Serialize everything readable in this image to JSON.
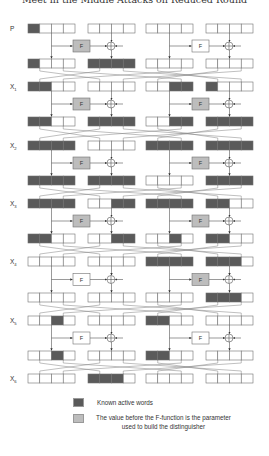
{
  "header": {
    "title": "Meet in the Middle Attacks on Reduced Round"
  },
  "colors": {
    "active": "#5a5a5a",
    "f_param": "#bdbdbd",
    "f_plain": "#ffffff",
    "stroke": "#707070",
    "line": "#808080"
  },
  "diagram": {
    "block_x": [
      28,
      88,
      146,
      206
    ],
    "cell_w": 11.75,
    "cell_h": 9,
    "f_box": [
      {
        "x": 73,
        "w": 17
      },
      {
        "x": 192,
        "w": 17
      }
    ],
    "xor_x": [
      111,
      229
    ],
    "f_label": "F",
    "rounds": [
      {
        "label": "P",
        "sub": "",
        "y": 24,
        "cells": [
          [
            1,
            0,
            0,
            0
          ],
          [
            0,
            0,
            0,
            0
          ],
          [
            0,
            0,
            0,
            0
          ],
          [
            0,
            0,
            0,
            0
          ]
        ],
        "f_shaded": [
          true,
          false
        ],
        "y_after": 59,
        "after": [
          [
            1,
            0,
            0,
            0
          ],
          [
            1,
            1,
            1,
            1
          ],
          [
            0,
            0,
            0,
            0
          ],
          [
            0,
            0,
            0,
            0
          ]
        ]
      },
      {
        "label": "X",
        "sub": "1",
        "y": 82,
        "cells": [
          [
            1,
            1,
            0,
            0
          ],
          [
            0,
            0,
            0,
            0
          ],
          [
            0,
            0,
            1,
            1
          ],
          [
            1,
            0,
            0,
            0
          ]
        ],
        "f_shaded": [
          true,
          true
        ],
        "y_after": 117,
        "after": [
          [
            1,
            1,
            0,
            0
          ],
          [
            1,
            1,
            1,
            1
          ],
          [
            0,
            0,
            1,
            1
          ],
          [
            1,
            1,
            1,
            1
          ]
        ]
      },
      {
        "label": "X",
        "sub": "2",
        "y": 141,
        "cells": [
          [
            1,
            1,
            1,
            1
          ],
          [
            0,
            0,
            0,
            0
          ],
          [
            1,
            1,
            1,
            1
          ],
          [
            1,
            1,
            1,
            1
          ]
        ],
        "f_shaded": [
          true,
          true
        ],
        "y_after": 176,
        "after": [
          [
            1,
            1,
            1,
            1
          ],
          [
            1,
            1,
            1,
            1
          ],
          [
            0,
            0,
            0,
            0
          ],
          [
            1,
            1,
            1,
            1
          ]
        ]
      },
      {
        "label": "X",
        "sub": "3",
        "y": 199,
        "cells": [
          [
            1,
            1,
            1,
            1
          ],
          [
            0,
            0,
            1,
            1
          ],
          [
            1,
            1,
            1,
            1
          ],
          [
            1,
            1,
            0,
            0
          ]
        ],
        "f_shaded": [
          true,
          true
        ],
        "y_after": 234,
        "after": [
          [
            1,
            1,
            0,
            0
          ],
          [
            0,
            0,
            1,
            1
          ],
          [
            0,
            0,
            1,
            0
          ],
          [
            1,
            1,
            0,
            0
          ]
        ]
      },
      {
        "label": "X",
        "sub": "4",
        "y": 257,
        "cells": [
          [
            0,
            0,
            0,
            0
          ],
          [
            0,
            0,
            0,
            0
          ],
          [
            1,
            1,
            1,
            1
          ],
          [
            1,
            1,
            1,
            0
          ]
        ],
        "f_shaded": [
          false,
          true
        ],
        "y_after": 293,
        "after": [
          [
            0,
            0,
            0,
            0
          ],
          [
            0,
            0,
            0,
            0
          ],
          [
            0,
            0,
            0,
            0
          ],
          [
            1,
            1,
            1,
            0
          ]
        ]
      },
      {
        "label": "X",
        "sub": "5",
        "y": 316,
        "cells": [
          [
            0,
            0,
            1,
            0
          ],
          [
            0,
            0,
            0,
            0
          ],
          [
            1,
            1,
            0,
            0
          ],
          [
            0,
            0,
            0,
            0
          ]
        ],
        "f_shaded": [
          false,
          false
        ],
        "y_after": 351,
        "after": [
          [
            0,
            0,
            1,
            0
          ],
          [
            0,
            0,
            0,
            0
          ],
          [
            1,
            1,
            0,
            0
          ],
          [
            0,
            0,
            0,
            0
          ]
        ]
      },
      {
        "label": "X",
        "sub": "6",
        "y": 374,
        "cells": [
          [
            0,
            0,
            0,
            0
          ],
          [
            1,
            1,
            1,
            0
          ],
          [
            0,
            0,
            0,
            0
          ],
          [
            0,
            0,
            0,
            0
          ]
        ]
      }
    ]
  },
  "legend": {
    "items": [
      {
        "swatch": "active",
        "text": "Known active words"
      },
      {
        "swatch": "f_param",
        "text": "The value before the F-function is the parameter used to build the distinguisher"
      }
    ]
  }
}
